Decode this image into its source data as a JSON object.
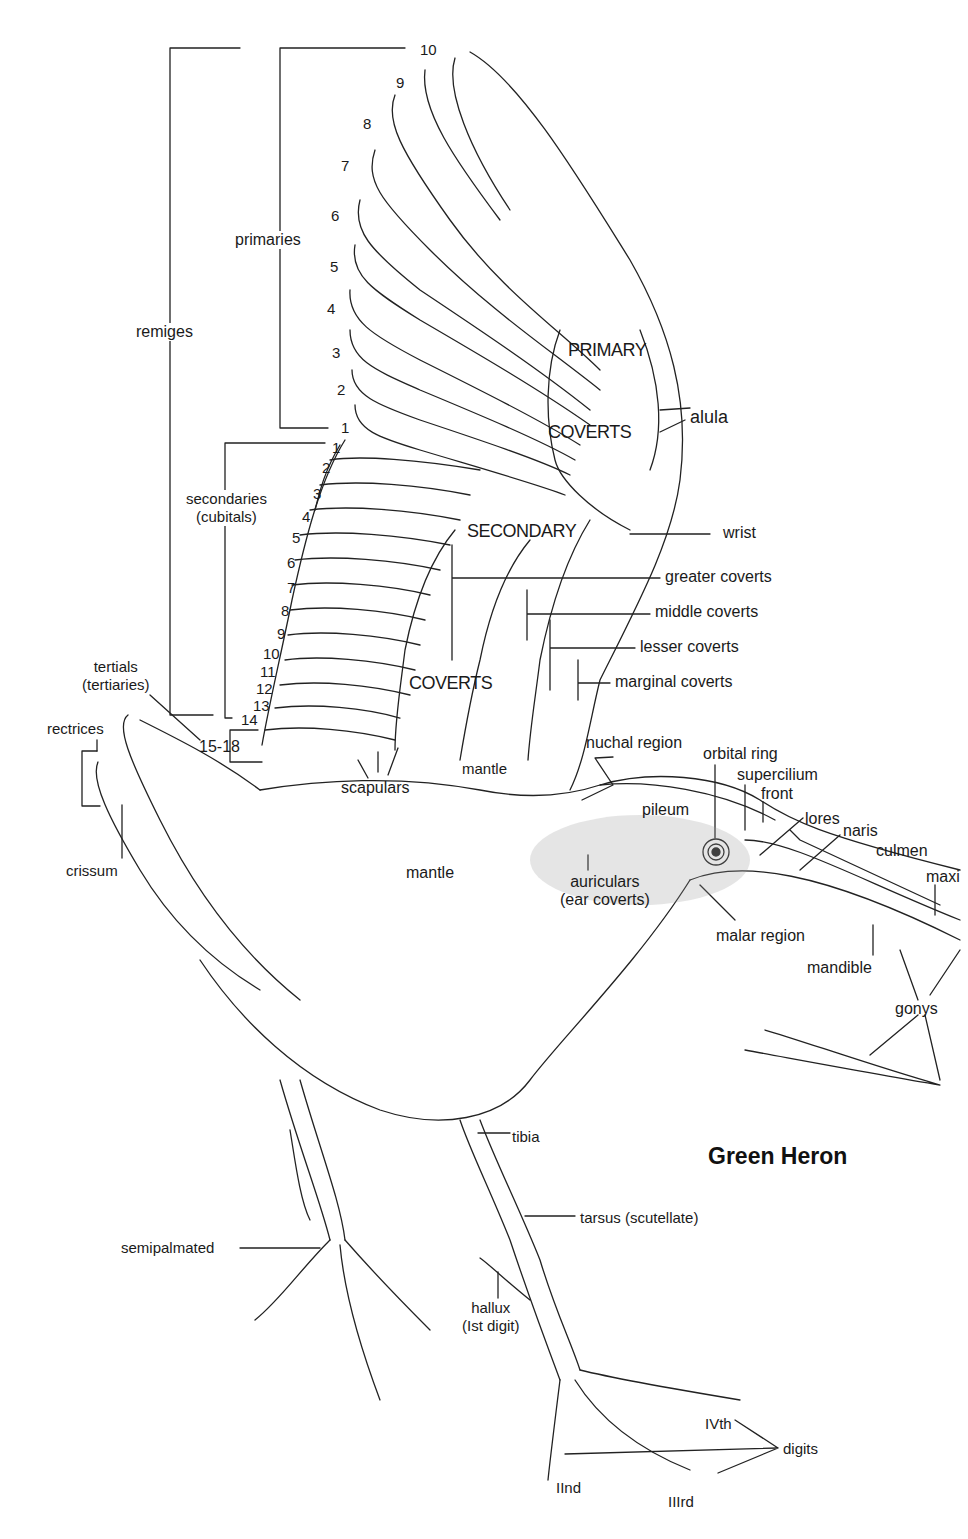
{
  "title": "Green Heron",
  "groups": {
    "remiges": "remiges",
    "primaries": "primaries",
    "secondaries": [
      "secondaries",
      "(cubitals)"
    ],
    "tertials": [
      "tertials",
      "(tertiaries)"
    ],
    "tertials_range": "15-18",
    "rectrices": "rectrices",
    "crissum": "crissum"
  },
  "primary_numbers": [
    "10",
    "9",
    "8",
    "7",
    "6",
    "5",
    "4",
    "3",
    "2",
    "1"
  ],
  "secondary_numbers": [
    "1",
    "2",
    "3",
    "4",
    "5",
    "6",
    "7",
    "8",
    "9",
    "10",
    "11",
    "12",
    "13",
    "14"
  ],
  "wing_regions": {
    "primary_coverts": [
      "PRIMARY",
      "COVERTS"
    ],
    "secondary_coverts": [
      "SECONDARY",
      "COVERTS"
    ]
  },
  "wing_labels": {
    "alula": "alula",
    "wrist": "wrist",
    "greater_coverts": "greater coverts",
    "middle_coverts": "middle coverts",
    "lesser_coverts": "lesser coverts",
    "marginal_coverts": "marginal coverts"
  },
  "body_labels": {
    "scapulars": "scapulars",
    "mantle_upper": "mantle",
    "mantle_body": "mantle",
    "nuchal_region": "nuchal region",
    "pileum": "pileum",
    "tibia": "tibia",
    "tarsus": "tarsus (scutellate)",
    "semipalmated": "semipalmated",
    "hallux": [
      "hallux",
      "(Ist digit)"
    ]
  },
  "head_labels": {
    "orbital_ring": "orbital ring",
    "supercilium": "supercilium",
    "front": "front",
    "lores": "lores",
    "naris": "naris",
    "culmen": "culmen",
    "maxilla": "maxi",
    "auriculars": [
      "auriculars",
      "(ear coverts)"
    ],
    "malar_region": "malar region",
    "mandible": "mandible",
    "gonys": "gonys"
  },
  "digits": {
    "label": "digits",
    "ii": "IInd",
    "iii": "IIIrd",
    "iv": "IVth"
  }
}
